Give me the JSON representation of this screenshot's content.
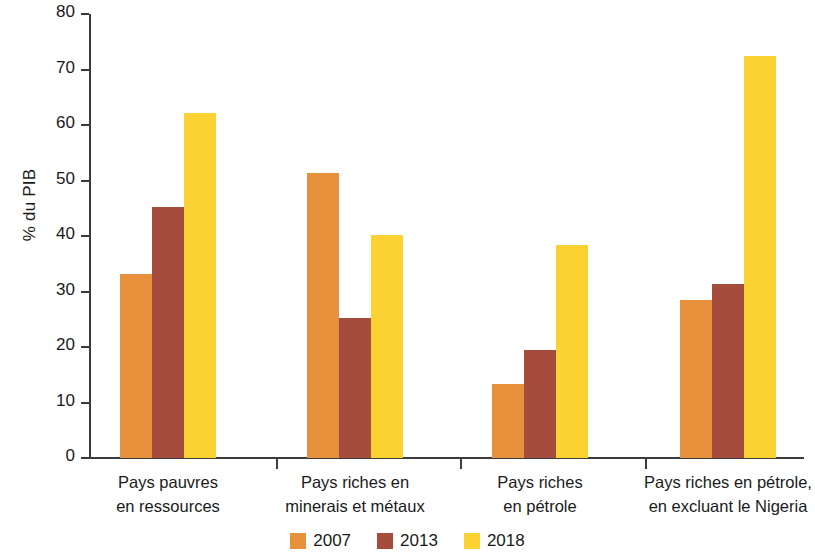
{
  "chart_data": {
    "type": "bar",
    "title": "",
    "subtitle": "",
    "xlabel": "",
    "ylabel": "% du PIB",
    "ylim": [
      0,
      80
    ],
    "ytick_step": 10,
    "yticks": [
      80,
      70,
      60,
      50,
      40,
      30,
      20,
      10,
      0
    ],
    "grid": false,
    "legend_position": "bottom-center",
    "categories": [
      "Pays pauvres en ressources",
      "Pays riches en minerais et métaux",
      "Pays riches en pétrole",
      "Pays riches en pétrole, en excluant le Nigeria"
    ],
    "category_lines": [
      [
        "Pays pauvres",
        "en ressources"
      ],
      [
        "Pays riches en",
        "minerais et métaux"
      ],
      [
        "Pays riches",
        "en pétrole"
      ],
      [
        "Pays riches en pétrole,",
        "en excluant le Nigeria"
      ]
    ],
    "series": [
      {
        "name": "2007",
        "color": "#e8913c",
        "values": [
          33.2,
          51.4,
          13.3,
          28.5
        ]
      },
      {
        "name": "2013",
        "color": "#a54c3d",
        "values": [
          45.2,
          25.3,
          19.4,
          31.4
        ]
      },
      {
        "name": "2018",
        "color": "#fbd231",
        "values": [
          62.2,
          40.2,
          38.4,
          72.5
        ]
      }
    ]
  },
  "axis": {
    "y_label": "% du PIB",
    "y_ticks": [
      "80",
      "70",
      "60",
      "50",
      "40",
      "30",
      "20",
      "10",
      "0"
    ]
  },
  "legend": {
    "items": [
      {
        "label": "2007",
        "color": "#e8913c"
      },
      {
        "label": "2013",
        "color": "#a54c3d"
      },
      {
        "label": "2018",
        "color": "#fbd231"
      }
    ]
  },
  "colors": {
    "series_2007": "#e8913c",
    "series_2013": "#a54c3d",
    "series_2018": "#fbd231",
    "axis": "#3b3b3b",
    "text": "#1a1a1a",
    "background": "#ffffff"
  }
}
